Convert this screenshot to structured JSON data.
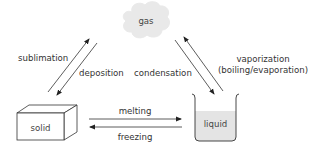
{
  "diagram": {
    "states": {
      "gas": "gas",
      "solid": "solid",
      "liquid": "liquid"
    },
    "transitions": {
      "sublimation": "sublimation",
      "deposition": "deposition",
      "condensation": "condensation",
      "vaporization_line1": "vaporization",
      "vaporization_line2": "(boiling/evaporation)",
      "melting": "melting",
      "freezing": "freezing"
    },
    "colors": {
      "cloud_fill": "#e9e9e9",
      "liquid_fill": "#e4e4e4",
      "line": "#333333",
      "text": "#333333"
    }
  }
}
